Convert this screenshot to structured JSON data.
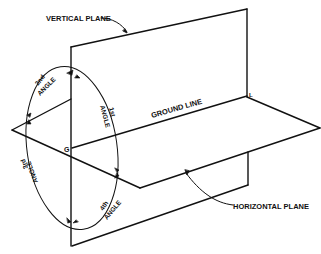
{
  "labels": {
    "vertical_plane": "VERTICAL PLANE",
    "horizontal_plane": "HORIZONTAL PLANE",
    "ground_line": "GROUND LINE",
    "point_g": "G",
    "point_l": "L"
  },
  "angles": [
    {
      "ordinal": "1st",
      "word": "ANGLE"
    },
    {
      "ordinal": "2nd",
      "word": "ANGLE"
    },
    {
      "ordinal": "3rd",
      "word": "ANGLE"
    },
    {
      "ordinal": "4th",
      "word": "ANGLE"
    }
  ],
  "colors": {
    "line": "#111111",
    "background": "#ffffff"
  }
}
